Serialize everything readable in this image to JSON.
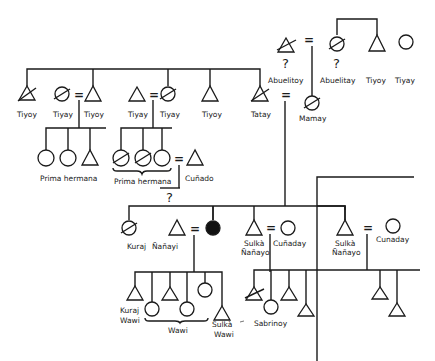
{
  "diagram": {
    "type": "kinship-chart",
    "colors": {
      "line": "#1a1a1a",
      "background": "#ffffff",
      "ego_fill": "#111111"
    },
    "legend_symbols": {
      "triangle": "male",
      "circle": "female",
      "slash": "deceased",
      "filled-circle": "ego",
      "equals": "marriage"
    },
    "generation_0": {
      "abuelitoy": {
        "label": "Abuelitoy",
        "symbol": "triangle-slashed",
        "mark": "?"
      },
      "abuelitay": {
        "label": "Abuelitay",
        "symbol": "circle-slashed",
        "mark": "?"
      },
      "tiyoy_maternal": {
        "label": "Tiyoy",
        "symbol": "triangle"
      },
      "tiyay_maternal": {
        "label": "Tiyay",
        "symbol": "circle"
      }
    },
    "generation_1": {
      "tiyoy_1": {
        "label": "Tiyoy",
        "symbol": "triangle-slashed"
      },
      "tiyay_1": {
        "label": "Tiyay",
        "symbol": "circle-slashed"
      },
      "tiyoy_2": {
        "label": "Tiyoy",
        "symbol": "triangle"
      },
      "tiyay_2": {
        "label": "Tiyay",
        "symbol": "triangle"
      },
      "tiyay_3": {
        "label": "Tiyay",
        "symbol": "circle-slashed"
      },
      "tiyoy_3": {
        "label": "Tiyoy",
        "symbol": "triangle"
      },
      "tatay": {
        "label": "Tatay",
        "symbol": "triangle-slashed"
      },
      "mamay": {
        "label": "Mamay",
        "symbol": "circle-slashed"
      }
    },
    "generation_2": {
      "prima_1": {
        "label": "Prima hermana"
      },
      "prima_2": {
        "label": "Prima hermana"
      },
      "cunado": {
        "label": "Cuñado"
      },
      "unknown_mark": "?",
      "kuraj_nanayi": {
        "label_1": "Kuraj",
        "label_2": "Ñañayi"
      },
      "sulka_nanayo_1": {
        "label_1": "Sulkà",
        "label_2": "Ñañayo"
      },
      "cunaday_1": {
        "label": "Cuñaday"
      },
      "sulka_nanayo_2": {
        "label_1": "Sulkà",
        "label_2": "Ñañayo"
      },
      "cunaday_2": {
        "label": "Cunaday"
      }
    },
    "generation_3": {
      "kuraj_wawi": {
        "label_1": "Kuraj",
        "label_2": "Wawi"
      },
      "wawi": {
        "label": "Wawi"
      },
      "sulka_wawi": {
        "label_1": "Sulkà",
        "label_2": "Wawi"
      },
      "sabrinoy": {
        "label": "Sabrinoy"
      }
    },
    "marriage_sign": "="
  }
}
